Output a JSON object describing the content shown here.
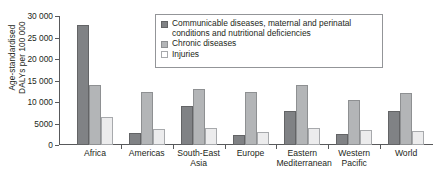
{
  "chart_data": {
    "type": "bar",
    "title": "",
    "xlabel": "",
    "ylabel_lines": [
      "Age-standardised",
      "DALYs per 100 000"
    ],
    "ylabel": "Age-standardised DALYs per 100 000",
    "categories": [
      "Africa",
      "Americas",
      "South-East Asia",
      "Europe",
      "Eastern Mediterranean",
      "Western Pacific",
      "World"
    ],
    "category_label_lines": [
      [
        "Africa"
      ],
      [
        "Americas"
      ],
      [
        "South-East",
        "Asia"
      ],
      [
        "Europe"
      ],
      [
        "Eastern",
        "Mediterranean"
      ],
      [
        "Western",
        "Pacific"
      ],
      [
        "World"
      ]
    ],
    "series": [
      {
        "name": "Communicable diseases, maternal and perinatal conditions and nutritional deficiencies",
        "color": "#808285",
        "values": [
          27900,
          2800,
          9000,
          2300,
          8000,
          2500,
          8000
        ]
      },
      {
        "name": "Chronic diseases",
        "color": "#b3b5b7",
        "values": [
          14000,
          12300,
          13000,
          12400,
          14000,
          10500,
          12200
        ]
      },
      {
        "name": "Injuries",
        "color": "#ececed",
        "values": [
          6500,
          3700,
          4000,
          3100,
          4000,
          3600,
          3300
        ]
      }
    ],
    "ylim": [
      0,
      30000
    ],
    "yticks": [
      0,
      5000,
      10000,
      15000,
      20000,
      25000,
      30000
    ],
    "ytick_labels": [
      "0",
      "5000",
      "10 000",
      "15 000",
      "20 000",
      "25 000",
      "30 000"
    ],
    "grid": false,
    "legend_position": "top-right",
    "legend_entries": [
      {
        "swatch": "dark-gray",
        "lines": [
          "Communicable diseases, maternal and perinatal",
          "conditions and nutritional deficiencies"
        ]
      },
      {
        "swatch": "mid-gray",
        "lines": [
          "Chronic diseases"
        ]
      },
      {
        "swatch": "light-gray",
        "lines": [
          "Injuries"
        ]
      }
    ]
  }
}
